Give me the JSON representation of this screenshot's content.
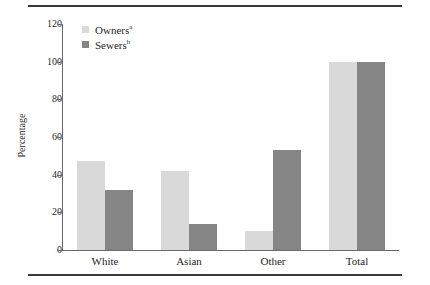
{
  "chart_data": {
    "type": "bar",
    "title": "",
    "xlabel": "",
    "ylabel": "Percentage",
    "ylim": [
      0,
      120
    ],
    "yticks": [
      0,
      20,
      40,
      60,
      80,
      100,
      120
    ],
    "ytick_labels": [
      "0",
      "20",
      "40",
      "60",
      "80",
      "100",
      "120"
    ],
    "grid": false,
    "legend_position": "top-left",
    "categories": [
      "White",
      "Asian",
      "Other",
      "Total"
    ],
    "series": [
      {
        "name": "Owners",
        "footnote": "a",
        "color": "#d9d9d9",
        "values": [
          47,
          42,
          10,
          100
        ]
      },
      {
        "name": "Sewers",
        "footnote": "b",
        "color": "#858585",
        "values": [
          32,
          14,
          53,
          100
        ]
      }
    ]
  },
  "figure": {
    "top_rule": "",
    "bottom_rule": ""
  }
}
